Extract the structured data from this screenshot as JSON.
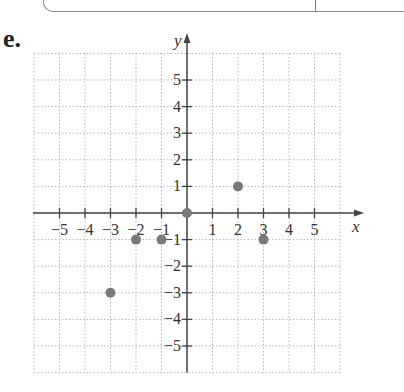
{
  "problem_label": "e.",
  "top_fragment": "...",
  "chart_data": {
    "type": "scatter",
    "title": "",
    "xlabel": "x",
    "ylabel": "y",
    "xlim": [
      -6,
      6
    ],
    "ylim": [
      -6,
      6
    ],
    "grid": true,
    "grid_style": "dotted",
    "x_ticks": [
      -5,
      -4,
      -3,
      -2,
      -1,
      1,
      2,
      3,
      4,
      5
    ],
    "y_ticks": [
      5,
      4,
      3,
      2,
      1,
      -1,
      -2,
      -3,
      -4,
      -5
    ],
    "points": [
      {
        "x": -3,
        "y": -3
      },
      {
        "x": -2,
        "y": -1
      },
      {
        "x": -1,
        "y": -1
      },
      {
        "x": 0,
        "y": 0
      },
      {
        "x": 2,
        "y": 1
      },
      {
        "x": 3,
        "y": -1
      }
    ],
    "point_color": "#7a7a7a",
    "axis_color": "#444444",
    "grid_color": "#b5b5b5"
  }
}
